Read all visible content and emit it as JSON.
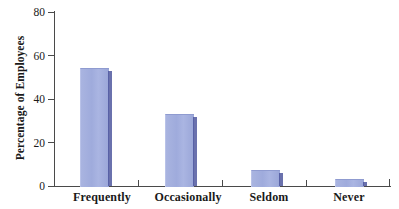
{
  "chart_data": {
    "type": "bar",
    "title": "",
    "subtitle": "",
    "xlabel": "",
    "ylabel": "Percentage of Employees",
    "categories": [
      "Frequently",
      "Occasionally",
      "Seldom",
      "Never"
    ],
    "values": [
      54,
      33,
      7,
      3
    ],
    "series": [
      {
        "name": "Percentage of Employees",
        "values": [
          54,
          33,
          7,
          3
        ]
      }
    ],
    "ylim": [
      0,
      80
    ],
    "ytick_labels": [
      "0",
      "20",
      "40",
      "60",
      "80"
    ],
    "ytick_values": [
      0,
      20,
      40,
      60,
      80
    ],
    "grid": false,
    "legend": false,
    "legend_position": "none",
    "bar_color": "#a3aede",
    "bar_shadow_color": "#49529b",
    "axis_color": "#4a4a4a",
    "background_color": "#ffffff",
    "text_color": "#1a1a1a"
  }
}
